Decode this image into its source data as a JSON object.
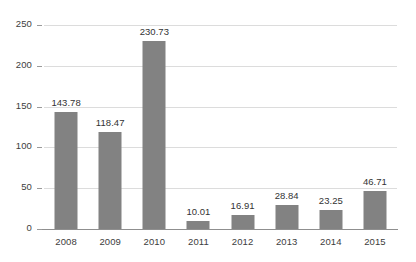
{
  "chart_data": {
    "type": "bar",
    "title": "",
    "xlabel": "",
    "ylabel": "",
    "categories": [
      "2008",
      "2009",
      "2010",
      "2011",
      "2012",
      "2013",
      "2014",
      "2015"
    ],
    "values": [
      143.78,
      118.47,
      230.73,
      10.01,
      16.91,
      28.84,
      23.25,
      46.71
    ],
    "value_labels": [
      "143.78",
      "118.47",
      "230.73",
      "10.01",
      "16.91",
      "28.84",
      "23.25",
      "46.71"
    ],
    "ylim": [
      0,
      250
    ],
    "yticks": [
      0,
      50,
      100,
      150,
      200,
      250
    ],
    "ytick_labels": [
      "0",
      "50",
      "100",
      "150",
      "200",
      "250"
    ],
    "grid": true,
    "legend": false,
    "legend_position": "none",
    "series": [
      {
        "name": "",
        "values": [
          143.78,
          118.47,
          230.73,
          10.01,
          16.91,
          28.84,
          23.25,
          46.71
        ]
      }
    ],
    "colors": {
      "bar": "#828282",
      "gridline": "#dcdcdc",
      "baseline": "#8f8f8f",
      "text": "#3d3d3d",
      "background": "#ffffff"
    }
  }
}
